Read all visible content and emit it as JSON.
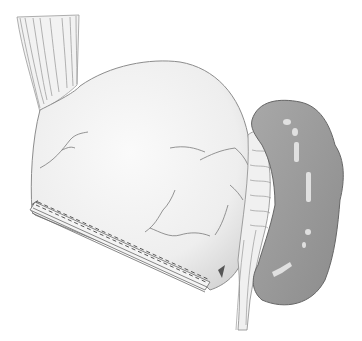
{
  "illustration": {
    "style": "grayscale pencil anatomical drawing",
    "background_color": "#ffffff",
    "elements": [
      {
        "name": "esophagus",
        "shade": "#d8d8d8"
      },
      {
        "name": "stomach-pouch",
        "shade": "#ececec"
      },
      {
        "name": "staple-line",
        "shade": "#555555"
      },
      {
        "name": "mesentery-vessels",
        "shade": "#e6e6e6"
      },
      {
        "name": "bowel-loop",
        "shade": "#9a9a9a"
      }
    ]
  }
}
